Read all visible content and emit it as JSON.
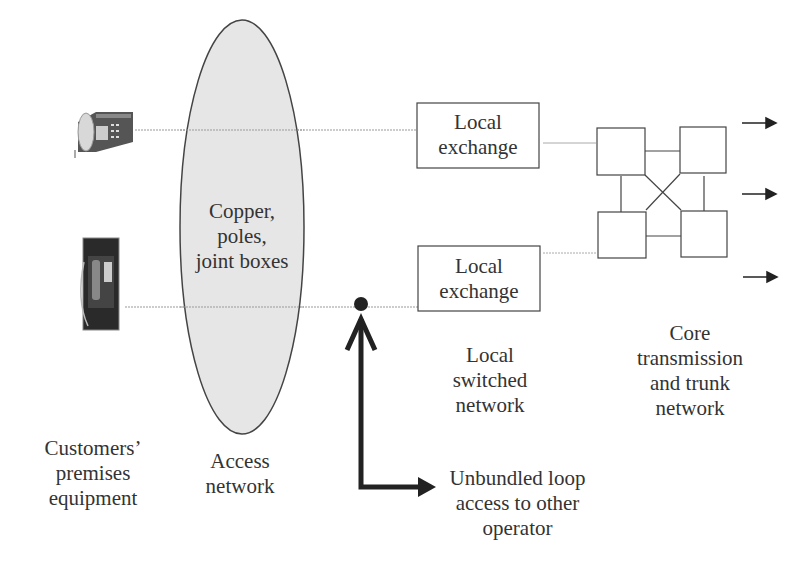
{
  "diagram": {
    "ellipse_text": [
      "Copper,",
      "poles,",
      "joint boxes"
    ],
    "exchange_top": [
      "Local",
      "exchange"
    ],
    "exchange_bottom": [
      "Local",
      "exchange"
    ],
    "labels": {
      "customers": [
        "Customers’",
        "premises",
        "equipment"
      ],
      "access": [
        "Access",
        "network"
      ],
      "local_switched": [
        "Local",
        "switched",
        "network"
      ],
      "core": [
        "Core",
        "transmission",
        "and trunk",
        "network"
      ],
      "unbundled": [
        "Unbundled loop",
        "access to other",
        "operator"
      ]
    },
    "icons": {
      "desk_phone": "desk-telephone-icon",
      "payphone": "payphone-icon"
    },
    "colors": {
      "ellipse_fill": "#e6e6e6",
      "stroke": "#333333",
      "line": "#999999",
      "arrow": "#222222"
    }
  }
}
